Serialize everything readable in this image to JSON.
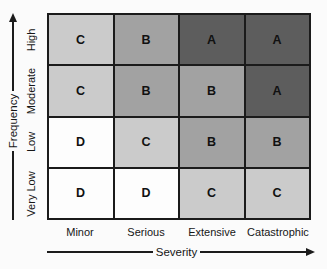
{
  "figure": {
    "y_axis": {
      "label": "Frequency",
      "categories": [
        "High",
        "Moderate",
        "Low",
        "Very Low"
      ]
    },
    "x_axis": {
      "label": "Severity",
      "categories": [
        "Minor",
        "Serious",
        "Extensive",
        "Catastrophic"
      ]
    },
    "rows": [
      {
        "cells": [
          {
            "letter": "C",
            "bg": "#cbcbcb"
          },
          {
            "letter": "B",
            "bg": "#a2a2a2"
          },
          {
            "letter": "A",
            "bg": "#5d5d5d"
          },
          {
            "letter": "A",
            "bg": "#5d5d5d"
          }
        ]
      },
      {
        "cells": [
          {
            "letter": "C",
            "bg": "#cbcbcb"
          },
          {
            "letter": "B",
            "bg": "#a2a2a2"
          },
          {
            "letter": "B",
            "bg": "#a2a2a2"
          },
          {
            "letter": "A",
            "bg": "#5d5d5d"
          }
        ]
      },
      {
        "cells": [
          {
            "letter": "D",
            "bg": "#fdfdfd"
          },
          {
            "letter": "C",
            "bg": "#cbcbcb"
          },
          {
            "letter": "B",
            "bg": "#a2a2a2"
          },
          {
            "letter": "B",
            "bg": "#a2a2a2"
          }
        ]
      },
      {
        "cells": [
          {
            "letter": "D",
            "bg": "#fdfdfd"
          },
          {
            "letter": "D",
            "bg": "#fdfdfd"
          },
          {
            "letter": "C",
            "bg": "#cbcbcb"
          },
          {
            "letter": "C",
            "bg": "#cbcbcb"
          }
        ]
      }
    ]
  },
  "chart_data": {
    "type": "heatmap",
    "x": [
      "Minor",
      "Serious",
      "Extensive",
      "Catastrophic"
    ],
    "y": [
      "High",
      "Moderate",
      "Low",
      "Very Low"
    ],
    "xlabel": "Severity",
    "ylabel": "Frequency",
    "values": [
      [
        "C",
        "B",
        "A",
        "A"
      ],
      [
        "C",
        "B",
        "B",
        "A"
      ],
      [
        "D",
        "C",
        "B",
        "B"
      ],
      [
        "D",
        "D",
        "C",
        "C"
      ]
    ],
    "cell_shading": {
      "A": "#5d5d5d",
      "B": "#a2a2a2",
      "C": "#cbcbcb",
      "D": "#fdfdfd"
    },
    "grid": "on",
    "legend_position": "none"
  },
  "colors": {
    "line": "#1b1b1b",
    "text": "#161616",
    "background": "#fbfbfb"
  }
}
